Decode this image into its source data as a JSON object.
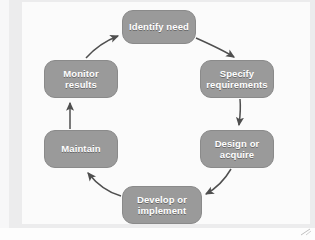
{
  "diagram": {
    "type": "cycle",
    "direction": "clockwise",
    "node_fill_color": "#9a9a9a",
    "node_text_color": "#ffffff",
    "arrow_color": "#555555",
    "background_color": "#ececed",
    "nodes": [
      {
        "id": "identify",
        "label": "Identify need",
        "position": "top"
      },
      {
        "id": "specify",
        "label": "Specify\nrequirements",
        "position": "top-right"
      },
      {
        "id": "design",
        "label": "Design or\nacquire",
        "position": "bottom-right"
      },
      {
        "id": "develop",
        "label": "Develop or\nimplement",
        "position": "bottom"
      },
      {
        "id": "maintain",
        "label": "Maintain",
        "position": "bottom-left"
      },
      {
        "id": "monitor",
        "label": "Monitor\nresults",
        "position": "top-left"
      }
    ],
    "edges": [
      {
        "from": "identify",
        "to": "specify",
        "style": "curved-arrow"
      },
      {
        "from": "specify",
        "to": "design",
        "style": "straight-arrow"
      },
      {
        "from": "design",
        "to": "develop",
        "style": "curved-arrow"
      },
      {
        "from": "develop",
        "to": "maintain",
        "style": "curved-arrow"
      },
      {
        "from": "maintain",
        "to": "monitor",
        "style": "straight-arrow"
      },
      {
        "from": "monitor",
        "to": "identify",
        "style": "curved-arrow"
      }
    ]
  }
}
